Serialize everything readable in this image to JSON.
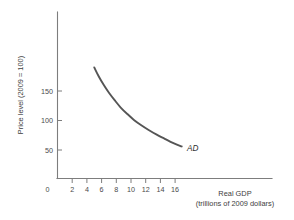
{
  "chart_data": {
    "type": "line",
    "title": "",
    "subtitle": "",
    "xlabel": "Real GDP",
    "xlabel_sub": "(trillions of 2009 dollars)",
    "ylabel": "Price level (2009 = 100)",
    "xlim": [
      0,
      18.5
    ],
    "ylim": [
      0,
      215
    ],
    "grid": false,
    "legend_position": "inline-right",
    "xticks": [
      0,
      2,
      4,
      6,
      8,
      10,
      12,
      14,
      16
    ],
    "xtick_labels": [
      "0",
      "2",
      "4",
      "6",
      "8",
      "10",
      "12",
      "14",
      "16"
    ],
    "yticks": [
      50,
      100,
      150
    ],
    "ytick_labels": [
      "50",
      "100",
      "150"
    ],
    "series": [
      {
        "name": "AD",
        "label": "AD",
        "color": "#555555",
        "annotation": "AD",
        "x": [
          5.0,
          5.6,
          6.3,
          7.0,
          7.8,
          8.6,
          9.5,
          10.4,
          11.4,
          12.4,
          13.5,
          14.6,
          15.7,
          16.9
        ],
        "y": [
          190,
          175,
          160,
          147,
          134,
          122,
          111,
          101,
          92,
          84,
          76,
          69,
          62,
          56
        ]
      }
    ],
    "annotations": [
      {
        "text": "AD",
        "x": 17.6,
        "y": 48,
        "style": "italic"
      }
    ]
  },
  "axes": {
    "x_axis_name": "x-axis",
    "y_axis_name": "y-axis"
  }
}
